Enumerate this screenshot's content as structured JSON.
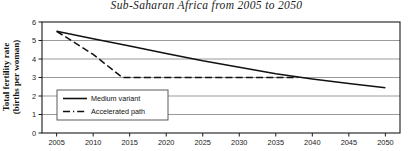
{
  "chart_data": {
    "type": "line",
    "title": "Sub-Saharan Africa from 2005 to 2050",
    "xlabel": "",
    "ylabel": "Total fertility rate (births per woman)",
    "ylabel_line1": "Total fertility rate",
    "ylabel_line2": "(births per woman)",
    "xlim": [
      2003,
      2052
    ],
    "ylim": [
      0,
      6
    ],
    "yticks": [
      "0",
      "1",
      "2",
      "3",
      "4",
      "5",
      "6"
    ],
    "ytick_values": [
      0,
      1,
      2,
      3,
      4,
      5,
      6
    ],
    "xticks": [
      "2005",
      "2010",
      "2015",
      "2020",
      "2025",
      "2030",
      "2035",
      "2040",
      "2045",
      "2050"
    ],
    "xtick_values": [
      2005,
      2010,
      2015,
      2020,
      2025,
      2030,
      2035,
      2040,
      2045,
      2050
    ],
    "grid": "horizontal",
    "legend_position": "lower-left-inside",
    "series": [
      {
        "name": "Medium variant",
        "style": "solid",
        "color": "#111111",
        "x": [
          2005,
          2010,
          2015,
          2020,
          2025,
          2030,
          2035,
          2040,
          2045,
          2050
        ],
        "values": [
          5.5,
          5.1,
          4.7,
          4.3,
          3.9,
          3.55,
          3.2,
          2.92,
          2.68,
          2.45
        ]
      },
      {
        "name": "Accelerated path",
        "style": "dashed",
        "color": "#111111",
        "x": [
          2005,
          2010,
          2014,
          2020,
          2025,
          2030,
          2035,
          2038
        ],
        "values": [
          5.5,
          4.25,
          3.0,
          3.0,
          3.0,
          3.0,
          3.0,
          3.0
        ]
      }
    ]
  },
  "legend": {
    "items": [
      {
        "label": "Medium variant",
        "style": "solid"
      },
      {
        "label": "Accelerated path",
        "style": "dashed"
      }
    ]
  }
}
